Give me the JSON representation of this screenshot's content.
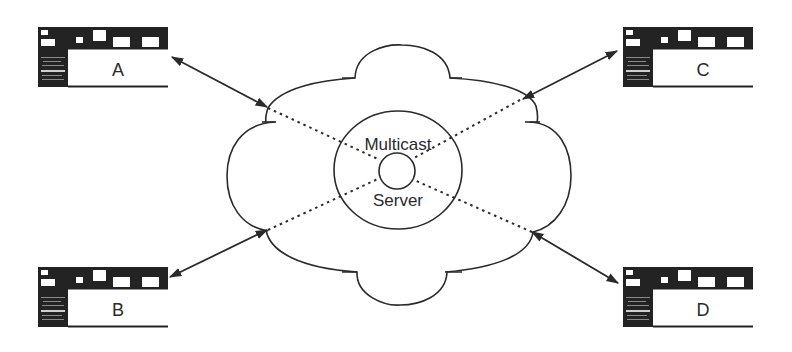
{
  "diagram": {
    "type": "network-topology",
    "center": {
      "label_top": "Multicast",
      "label_bottom": "Server",
      "container": "network-cloud"
    },
    "terminals": [
      {
        "id": "A",
        "label": "A",
        "position": "top-left"
      },
      {
        "id": "B",
        "label": "B",
        "position": "bottom-left"
      },
      {
        "id": "C",
        "label": "C",
        "position": "top-right"
      },
      {
        "id": "D",
        "label": "D",
        "position": "bottom-right"
      }
    ],
    "connections": [
      {
        "from": "A",
        "to": "cloud",
        "style": "solid",
        "arrows": "both"
      },
      {
        "from": "B",
        "to": "cloud",
        "style": "solid",
        "arrows": "both"
      },
      {
        "from": "C",
        "to": "cloud",
        "style": "solid",
        "arrows": "both"
      },
      {
        "from": "D",
        "to": "cloud",
        "style": "solid",
        "arrows": "both"
      },
      {
        "from": "cloud-edge",
        "to": "Multicast Server",
        "style": "dotted"
      }
    ],
    "colors": {
      "ink": "#2a2a2a",
      "background": "#ffffff"
    }
  }
}
